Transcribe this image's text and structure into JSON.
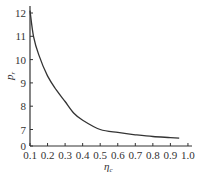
{
  "chart_data": {
    "type": "line",
    "title": "",
    "xlabel": "η_c",
    "ylabel": "p_r",
    "xlim": [
      0.1,
      1.0
    ],
    "ylim": [
      0,
      12
    ],
    "y_axis_break": "between 0 and 7",
    "x_ticks": [
      "0.1",
      "0.2",
      "0.3",
      "0.4",
      "0.5",
      "0.6",
      "0.7",
      "0.8",
      "0.9",
      "1.0"
    ],
    "y_ticks": [
      "0",
      "7",
      "8",
      "9",
      "10",
      "11",
      "12"
    ],
    "grid": false,
    "legend": null,
    "series": [
      {
        "name": "p_r vs η_c",
        "x": [
          0.1,
          0.12,
          0.15,
          0.2,
          0.25,
          0.3,
          0.35,
          0.4,
          0.5,
          0.6,
          0.7,
          0.8,
          0.9,
          0.95
        ],
        "y": [
          12.1,
          11.0,
          10.2,
          9.3,
          8.7,
          8.2,
          7.7,
          7.4,
          7.0,
          6.7,
          6.5,
          6.35,
          6.25,
          6.2
        ]
      }
    ]
  },
  "labels": {
    "x_axis_main": "η",
    "x_axis_sub": "c",
    "y_axis_main": "p",
    "y_axis_sub": "r"
  }
}
